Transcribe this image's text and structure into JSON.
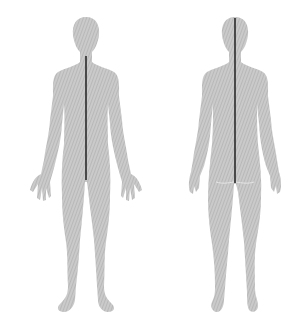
{
  "diagram": {
    "figures": [
      {
        "view": "front",
        "midline": {
          "x": 86,
          "y1": 56,
          "y2": 180
        }
      },
      {
        "view": "back",
        "midline": {
          "x": 235,
          "y1": 18,
          "y2": 183
        }
      }
    ],
    "colors": {
      "body": "#c8c8c8",
      "hatch": "#b4b4b4",
      "midline": "#2a2a2a",
      "background": "#ffffff"
    }
  }
}
